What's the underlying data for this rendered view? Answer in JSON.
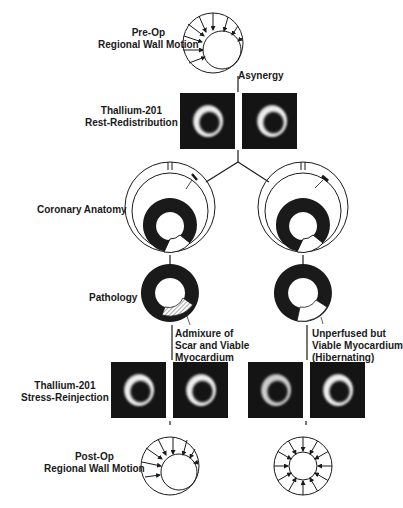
{
  "rows": {
    "preop": {
      "line1": "Pre-Op",
      "line2": "Regional Wall Motion"
    },
    "asynergy": "Asynergy",
    "rest": {
      "line1": "Thallium-201",
      "line2": "Rest-Redistribution"
    },
    "coronary": "Coronary Anatomy",
    "pathology": "Pathology",
    "stress": {
      "line1": "Thallium-201",
      "line2": "Stress-Reinjection"
    },
    "postop": {
      "line1": "Post-Op",
      "line2": "Regional Wall Motion"
    }
  },
  "branches": {
    "left": {
      "stenosis": "40%",
      "pathology_note": {
        "line1": "Admixure of",
        "line2": "Scar and Viable",
        "line3": "Myocardium"
      }
    },
    "right": {
      "stenosis": "90%",
      "pathology_note": {
        "line1": "Unperfused but",
        "line2": "Viable Myocardium",
        "line3": "(Hibernating)"
      }
    }
  },
  "colors": {
    "ink": "#1a1a1a",
    "scan_bg": "#141414",
    "background": "#ffffff"
  }
}
